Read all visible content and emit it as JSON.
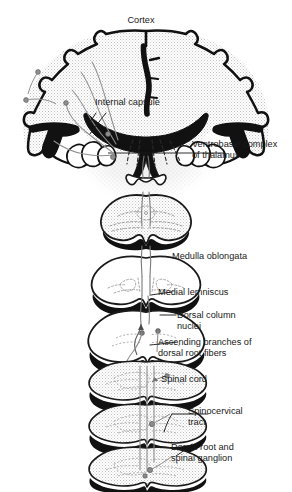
{
  "figure": {
    "background_color": "#ffffff",
    "ink_color": "#1a1a1a",
    "stipple_color": "#b9b9b9",
    "tract_color": "#6e6e6e",
    "width": 292,
    "height": 492
  },
  "labels": {
    "cortex": "Cortex",
    "internal_capsule": "Internal capsule",
    "ventrobasal_1": "Ventrobasal complex",
    "ventrobasal_2": "of thalamus",
    "medulla": "Medulla oblongata",
    "medial_lemniscus": "Medial lemniscus",
    "dorsal_column_1": "Dorsal column",
    "dorsal_column_2": "nuclei",
    "ascending_1": "Ascending branches of",
    "ascending_2": "dorsal root fibers",
    "spinal_cord": "Spinal cord",
    "spinocervical_1": "Spinocervical",
    "spinocervical_2": "tract",
    "dorsal_root_1": "Dorsal root and",
    "dorsal_root_2": "spinal ganglion"
  },
  "structures": {
    "cerebrum": "cerebral-hemispheres-coronal-section",
    "thalamus": "ventrobasal-thalamic-nuclei",
    "midbrain": "midbrain-cross-section",
    "pons": "pons-cross-section",
    "medulla": "medulla-oblongata-cross-section",
    "dorsal_column_nuclei": "dorsal-column-nuclei-section",
    "spinal_sections": [
      "spinal-cord-section-1",
      "spinal-cord-section-2",
      "spinal-cord-section-3",
      "spinal-cord-section-4"
    ]
  }
}
